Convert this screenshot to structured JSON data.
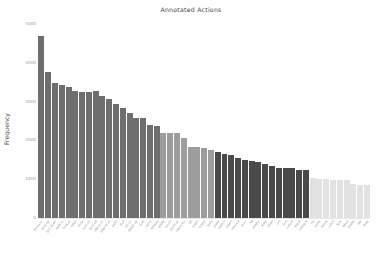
{
  "chart_data": {
    "type": "bar",
    "title": "Annotated Actions",
    "xlabel": "",
    "ylabel": "Frequency",
    "grid": false,
    "legend": false,
    "ylim": [
      0,
      5000
    ],
    "ytick_labels": [
      "0",
      "1000",
      "2000",
      "3000",
      "4000",
      "5000"
    ],
    "ytick_values": [
      0,
      1000,
      2000,
      3000,
      4000,
      5000
    ],
    "categories": [
      "move to",
      "pick up",
      "put down",
      "walk to",
      "look at",
      "open",
      "close",
      "turn on",
      "turn off",
      "place on",
      "take from",
      "push",
      "pull",
      "sit on",
      "stand up",
      "hold",
      "carry",
      "release",
      "grasp",
      "touch",
      "point at",
      "reach for",
      "lift",
      "lower",
      "rotate",
      "slide",
      "press",
      "switch",
      "insert",
      "remove",
      "pour",
      "fill",
      "empty",
      "wipe",
      "clean",
      "cut",
      "fold",
      "unfold",
      "stack",
      "unstack",
      "tie",
      "untie",
      "throw",
      "catch",
      "kick",
      "wave",
      "shake",
      "tap",
      "drag"
    ],
    "values": [
      4680,
      3770,
      3490,
      3420,
      3380,
      3280,
      3260,
      3260,
      3270,
      3140,
      3080,
      2950,
      2830,
      2700,
      2590,
      2570,
      2400,
      2370,
      2200,
      2190,
      2180,
      2060,
      1840,
      1820,
      1800,
      1760,
      1700,
      1660,
      1620,
      1540,
      1500,
      1470,
      1440,
      1400,
      1330,
      1300,
      1300,
      1280,
      1240,
      1230,
      1030,
      1010,
      1000,
      990,
      980,
      970,
      880,
      860,
      860
    ],
    "bar_colors": [
      "#6e6e6e",
      "#6e6e6e",
      "#6e6e6e",
      "#6e6e6e",
      "#6e6e6e",
      "#6e6e6e",
      "#6e6e6e",
      "#6e6e6e",
      "#6e6e6e",
      "#6e6e6e",
      "#6e6e6e",
      "#6e6e6e",
      "#6e6e6e",
      "#6e6e6e",
      "#6e6e6e",
      "#6e6e6e",
      "#6e6e6e",
      "#6e6e6e",
      "#9d9d9d",
      "#9d9d9d",
      "#9d9d9d",
      "#9d9d9d",
      "#9d9d9d",
      "#9d9d9d",
      "#9d9d9d",
      "#9d9d9d",
      "#4a4a4a",
      "#4a4a4a",
      "#4a4a4a",
      "#4a4a4a",
      "#4a4a4a",
      "#4a4a4a",
      "#4a4a4a",
      "#4a4a4a",
      "#4a4a4a",
      "#4a4a4a",
      "#4a4a4a",
      "#4a4a4a",
      "#4a4a4a",
      "#4a4a4a",
      "#e2e2e2",
      "#e2e2e2",
      "#e2e2e2",
      "#e2e2e2",
      "#e2e2e2",
      "#e2e2e2",
      "#e2e2e2",
      "#e2e2e2",
      "#e2e2e2"
    ],
    "color_groups": [
      {
        "name": "group-1",
        "color": "#6e6e6e",
        "count": 18
      },
      {
        "name": "group-2",
        "color": "#9d9d9d",
        "count": 8
      },
      {
        "name": "group-3",
        "color": "#4a4a4a",
        "count": 14
      },
      {
        "name": "group-4",
        "color": "#e2e2e2",
        "count": 9
      }
    ]
  }
}
